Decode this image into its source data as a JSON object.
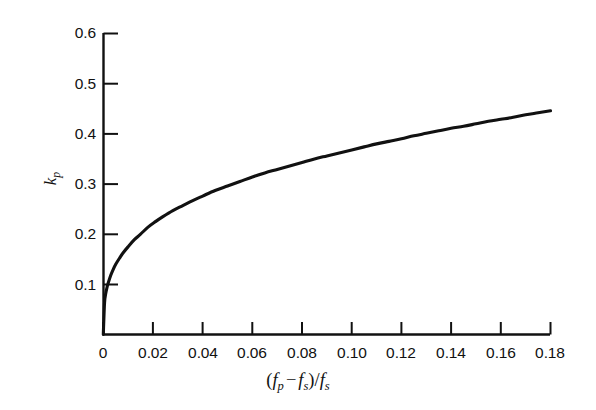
{
  "figure": {
    "background_color": "#ffffff",
    "line_color": "#111111",
    "axis_color": "#111111"
  },
  "axes": {
    "y_title_base": "k",
    "y_title_sub": "p",
    "x_title": {
      "open_paren": "(",
      "f1_base": "f",
      "f1_sub": "p",
      "minus": "−",
      "f2_base": "f",
      "f2_sub": "s",
      "close_paren": ")",
      "slash": "/",
      "f3_base": "f",
      "f3_sub": "s"
    }
  },
  "chart_data": {
    "type": "line",
    "title": "",
    "xlabel": "(f_p - f_s)/f_s",
    "ylabel": "k_p",
    "xlim": [
      0,
      0.18
    ],
    "ylim": [
      0,
      0.6
    ],
    "grid": false,
    "legend": null,
    "xticks": [
      0,
      0.02,
      0.04,
      0.06,
      0.08,
      0.1,
      0.12,
      0.14,
      0.16,
      0.18
    ],
    "xtick_labels": [
      "0",
      "0.02",
      "0.04",
      "0.06",
      "0.08",
      "0.10",
      "0.12",
      "0.14",
      "0.16",
      "0.18"
    ],
    "yticks": [
      0,
      0.1,
      0.2,
      0.3,
      0.4,
      0.5,
      0.6
    ],
    "ytick_labels": [
      "",
      "0.1",
      "0.2",
      "0.3",
      "0.4",
      "0.5",
      "0.6"
    ],
    "series": [
      {
        "name": "kp",
        "x": [
          0.0,
          0.0005,
          0.001,
          0.0015,
          0.002,
          0.003,
          0.004,
          0.005,
          0.0065,
          0.008,
          0.01,
          0.0125,
          0.015,
          0.018,
          0.021,
          0.024,
          0.028,
          0.032,
          0.036,
          0.04,
          0.045,
          0.05,
          0.055,
          0.06,
          0.065,
          0.07,
          0.075,
          0.08,
          0.085,
          0.09,
          0.095,
          0.1,
          0.105,
          0.11,
          0.115,
          0.12,
          0.125,
          0.13,
          0.135,
          0.14,
          0.145,
          0.15,
          0.155,
          0.16,
          0.165,
          0.17,
          0.175,
          0.18
        ],
        "y": [
          0.0,
          0.063,
          0.082,
          0.094,
          0.103,
          0.118,
          0.13,
          0.14,
          0.152,
          0.163,
          0.175,
          0.189,
          0.2,
          0.214,
          0.225,
          0.235,
          0.247,
          0.257,
          0.267,
          0.276,
          0.287,
          0.296,
          0.305,
          0.314,
          0.322,
          0.329,
          0.336,
          0.343,
          0.35,
          0.356,
          0.362,
          0.368,
          0.374,
          0.38,
          0.385,
          0.39,
          0.396,
          0.401,
          0.406,
          0.411,
          0.415,
          0.42,
          0.425,
          0.429,
          0.433,
          0.438,
          0.442,
          0.446
        ]
      }
    ]
  }
}
